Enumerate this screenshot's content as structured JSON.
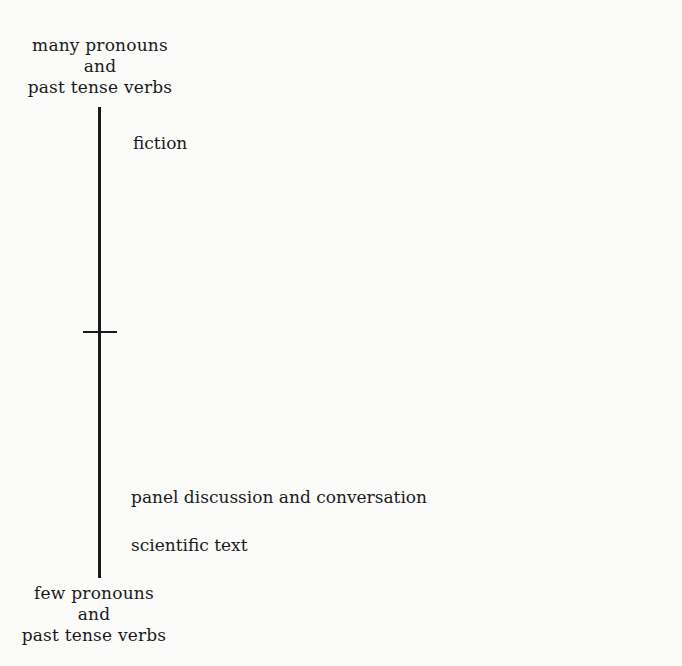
{
  "diagram": {
    "type": "single-dimension scale",
    "axis": {
      "top_pole": [
        "many pronouns",
        "and",
        "past tense verbs"
      ],
      "bottom_pole": [
        "few pronouns",
        "and",
        "past tense verbs"
      ],
      "midpoint_tick": true
    },
    "points": [
      {
        "label": "fiction",
        "position": "high"
      },
      {
        "label": "panel discussion and conversation",
        "position": "low"
      },
      {
        "label": "scientific text",
        "position": "lowest"
      }
    ]
  }
}
